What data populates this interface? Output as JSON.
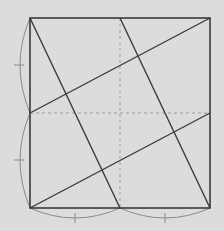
{
  "colors": {
    "background": "#dcdcdc",
    "stroke_main": "#3a3a3a",
    "stroke_light": "#8a8a8a",
    "stroke_dashed": "#9a9a9a"
  },
  "square": {
    "x1": 30,
    "y1": 18,
    "x2": 210,
    "y2": 208
  },
  "dashed_lines": [
    {
      "x1": 30,
      "y1": 113,
      "x2": 210,
      "y2": 113
    },
    {
      "x1": 120,
      "y1": 18,
      "x2": 120,
      "y2": 208
    }
  ],
  "segments": [
    {
      "x1": 30,
      "y1": 18,
      "x2": 120,
      "y2": 208
    },
    {
      "x1": 120,
      "y1": 18,
      "x2": 210,
      "y2": 208
    },
    {
      "x1": 30,
      "y1": 113,
      "x2": 210,
      "y2": 18
    },
    {
      "x1": 30,
      "y1": 208,
      "x2": 210,
      "y2": 113
    }
  ],
  "braces": [
    {
      "d": "M30,18 Q10,65 30,113",
      "tick": {
        "x1": 14,
        "y1": 65,
        "x2": 24,
        "y2": 65
      }
    },
    {
      "d": "M30,113 Q10,160 30,208",
      "tick": {
        "x1": 14,
        "y1": 160,
        "x2": 24,
        "y2": 160
      }
    },
    {
      "d": "M30,208 Q75,228 120,208",
      "tick": {
        "x1": 75,
        "y1": 213,
        "x2": 75,
        "y2": 223
      }
    },
    {
      "d": "M120,208 Q165,228 210,208",
      "tick": {
        "x1": 165,
        "y1": 213,
        "x2": 165,
        "y2": 223
      }
    }
  ]
}
